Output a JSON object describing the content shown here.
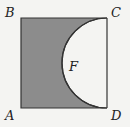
{
  "diagram": {
    "type": "geometry",
    "vertices": {
      "A": {
        "label": "A",
        "x": 21,
        "y": 108
      },
      "B": {
        "label": "B",
        "x": 21,
        "y": 18
      },
      "C": {
        "label": "C",
        "x": 107,
        "y": 18
      },
      "D": {
        "label": "D",
        "x": 107,
        "y": 108
      }
    },
    "region_label": "F",
    "colors": {
      "shaded": "#8c8c8c",
      "stroke": "#333333",
      "background": "#f4f4f2",
      "semicircle_fill": "#f4f4f2"
    }
  }
}
